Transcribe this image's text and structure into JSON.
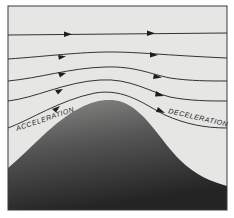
{
  "diagram": {
    "type": "airflow-over-hill",
    "labels": {
      "left": "ACCELERATION",
      "right": "DECELERATION"
    },
    "colors": {
      "sky": "#e6e6e4",
      "frame": "#3a3a3a",
      "streamline": "#1e1e1e",
      "hill_top": "#7a7a78",
      "hill_bottom": "#2a2a2a",
      "text": "#222222"
    },
    "streamline_count": 5
  }
}
